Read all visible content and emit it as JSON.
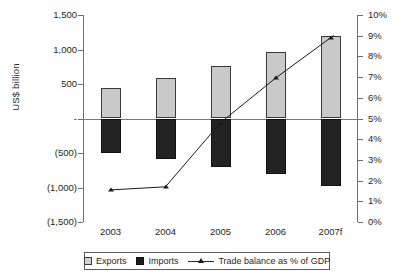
{
  "chart_data": {
    "type": "bar",
    "title": "",
    "subtitle": "",
    "xlabel": "",
    "ylabel": "US$ billion",
    "y2label": "",
    "categories": [
      "2003",
      "2004",
      "2005",
      "2006",
      "2007f"
    ],
    "ylim": [
      -1500,
      1500
    ],
    "y2lim": [
      0,
      10
    ],
    "yticks": [
      1500,
      1000,
      500,
      0,
      -500,
      -1000,
      -1500
    ],
    "ytick_labels": [
      "1,500",
      "1,000",
      "500",
      "-",
      "(500)",
      "(1,000)",
      "(1,500)"
    ],
    "y2ticks": [
      10,
      9,
      8,
      7,
      6,
      5,
      4,
      3,
      2,
      1,
      0
    ],
    "y2tick_labels": [
      "10%",
      "9%",
      "8%",
      "7%",
      "6%",
      "5%",
      "4%",
      "3%",
      "2%",
      "1%",
      "0%"
    ],
    "grid": false,
    "legend_position": "bottom",
    "series": [
      {
        "name": "Exports",
        "type": "bar",
        "axis": "left",
        "color": "#c9c9c9",
        "values": [
          442,
          587,
          762,
          970,
          1200
        ]
      },
      {
        "name": "Imports",
        "type": "bar",
        "axis": "left",
        "color": "#232323",
        "values": [
          -500,
          -587,
          -700,
          -805,
          -980
        ]
      },
      {
        "name": "Trade balance as % of GDP",
        "type": "line",
        "axis": "right",
        "color": "#1a1a1a",
        "marker": "triangle",
        "values": [
          1.55,
          1.7,
          4.8,
          6.95,
          8.9
        ]
      }
    ]
  },
  "axes": {
    "y_title": "US$ billion"
  },
  "legend": {
    "items": [
      {
        "label": "Exports",
        "swatch": "square-light"
      },
      {
        "label": "Imports",
        "swatch": "square-dark"
      },
      {
        "label": "Trade balance as % of GDP",
        "swatch": "line-triangle"
      }
    ]
  }
}
